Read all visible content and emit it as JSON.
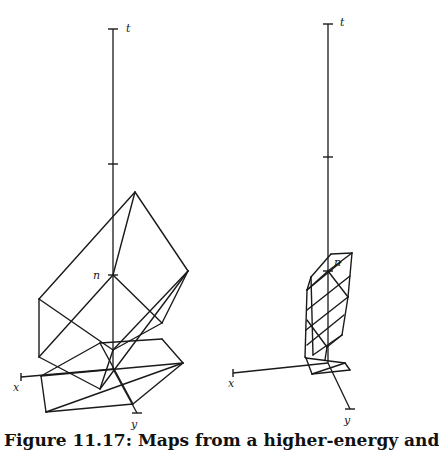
{
  "figure": {
    "caption": "Figure 11.17: Maps from a higher-energy and",
    "panels": [
      {
        "name": "left",
        "axes": {
          "t_axis": {
            "x": 113,
            "y_top": 29,
            "y_bottom": 369,
            "label": "t",
            "label_pos": [
              126,
              32
            ]
          },
          "ticks": [
            [
              113,
              29
            ],
            [
              113,
              164
            ],
            [
              113,
              275
            ]
          ],
          "x_axis": {
            "from": [
              113,
              369
            ],
            "to": [
              21,
              377
            ],
            "label": "x",
            "label_pos": [
              13,
              391
            ]
          },
          "y_axis": {
            "from": [
              113,
              369
            ],
            "to": [
              137,
              413
            ],
            "label": "y",
            "label_pos": [
              131,
              428
            ]
          },
          "n_label": {
            "text": "n",
            "pos": [
              93,
              279
            ]
          }
        },
        "edges": [
          [
            [
              135,
              192
            ],
            [
              39,
              299
            ]
          ],
          [
            [
              135,
              192
            ],
            [
              188,
              271
            ]
          ],
          [
            [
              135,
              192
            ],
            [
              113,
              275
            ]
          ],
          [
            [
              113,
              275
            ],
            [
              39,
              357
            ]
          ],
          [
            [
              113,
              275
            ],
            [
              162,
              323
            ]
          ],
          [
            [
              39,
              299
            ],
            [
              39,
              357
            ]
          ],
          [
            [
              39,
              299
            ],
            [
              113,
              350
            ]
          ],
          [
            [
              188,
              271
            ],
            [
              162,
              323
            ]
          ],
          [
            [
              188,
              271
            ],
            [
              113,
              350
            ]
          ],
          [
            [
              188,
              271
            ],
            [
              100,
              389
            ]
          ],
          [
            [
              39,
              357
            ],
            [
              100,
              389
            ]
          ],
          [
            [
              162,
              323
            ],
            [
              113,
              350
            ]
          ],
          [
            [
              100,
              343
            ],
            [
              162,
              339
            ]
          ],
          [
            [
              162,
              339
            ],
            [
              183,
              363
            ]
          ],
          [
            [
              100,
              343
            ],
            [
              41,
              376
            ]
          ],
          [
            [
              100,
              343
            ],
            [
              133,
              404
            ]
          ],
          [
            [
              183,
              363
            ],
            [
              133,
              404
            ]
          ],
          [
            [
              41,
              376
            ],
            [
              46,
              412
            ]
          ],
          [
            [
              46,
              412
            ],
            [
              133,
              404
            ]
          ],
          [
            [
              46,
              412
            ],
            [
              183,
              363
            ]
          ],
          [
            [
              41,
              376
            ],
            [
              183,
              363
            ]
          ],
          [
            [
              113,
              350
            ],
            [
              100,
              389
            ]
          ]
        ]
      },
      {
        "name": "right",
        "axes": {
          "t_axis": {
            "x": 328,
            "y_top": 24,
            "y_bottom": 363,
            "label": "t",
            "label_pos": [
              340,
              26
            ]
          },
          "ticks": [
            [
              328,
              24
            ],
            [
              328,
              157
            ],
            [
              328,
              271
            ]
          ],
          "x_axis": {
            "from": [
              328,
              363
            ],
            "to": [
              233,
              373
            ],
            "label": "x",
            "label_pos": [
              228,
              387
            ]
          },
          "y_axis": {
            "from": [
              328,
              363
            ],
            "to": [
              350,
              409
            ],
            "label": "y",
            "label_pos": [
              344,
              424
            ]
          },
          "n_label": {
            "text": "n",
            "pos": [
              334,
              266
            ]
          }
        },
        "edges": [
          [
            [
              331,
              254
            ],
            [
              352,
              253
            ]
          ],
          [
            [
              331,
              254
            ],
            [
              311,
              277
            ]
          ],
          [
            [
              352,
              253
            ],
            [
              348,
              297
            ]
          ],
          [
            [
              352,
              253
            ],
            [
              328,
              271
            ]
          ],
          [
            [
              311,
              277
            ],
            [
              307,
              290
            ]
          ],
          [
            [
              307,
              290
            ],
            [
              305,
              357
            ]
          ],
          [
            [
              311,
              277
            ],
            [
              313,
              355
            ]
          ],
          [
            [
              328,
              271
            ],
            [
              307,
              290
            ]
          ],
          [
            [
              328,
              271
            ],
            [
              348,
              297
            ]
          ],
          [
            [
              348,
              297
            ],
            [
              342,
              335
            ]
          ],
          [
            [
              342,
              335
            ],
            [
              327,
              347
            ]
          ],
          [
            [
              307,
              320
            ],
            [
              327,
              347
            ]
          ],
          [
            [
              307,
              290
            ],
            [
              341,
              262
            ]
          ],
          [
            [
              307,
              310
            ],
            [
              350,
              276
            ]
          ],
          [
            [
              306,
              330
            ],
            [
              348,
              297
            ]
          ],
          [
            [
              307,
              345
            ],
            [
              344,
              315
            ]
          ],
          [
            [
              313,
              355
            ],
            [
              342,
              335
            ]
          ],
          [
            [
              305,
              357
            ],
            [
              306,
              358
            ]
          ],
          [
            [
              306,
              358
            ],
            [
              345,
              363
            ]
          ],
          [
            [
              345,
              363
            ],
            [
              350,
              370
            ]
          ],
          [
            [
              350,
              370
            ],
            [
              312,
              374
            ]
          ],
          [
            [
              312,
              374
            ],
            [
              306,
              358
            ]
          ],
          [
            [
              327,
              347
            ],
            [
              325,
              360
            ]
          ],
          [
            [
              312,
              374
            ],
            [
              345,
              363
            ]
          ]
        ]
      }
    ]
  }
}
